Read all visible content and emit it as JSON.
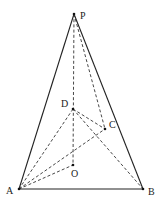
{
  "diagram": {
    "type": "geometry-3d-pyramid",
    "points": {
      "P": {
        "x": 74,
        "y": 14,
        "label": "P",
        "lx": 80,
        "ly": 19
      },
      "D": {
        "x": 73,
        "y": 109,
        "label": "D",
        "lx": 61,
        "ly": 107
      },
      "C": {
        "x": 105,
        "y": 129,
        "label": "C",
        "lx": 109,
        "ly": 128
      },
      "O": {
        "x": 73,
        "y": 165,
        "label": "O",
        "lx": 71,
        "ly": 177
      },
      "A": {
        "x": 19,
        "y": 189,
        "label": "A",
        "lx": 6,
        "ly": 194
      },
      "B": {
        "x": 143,
        "y": 189,
        "label": "B",
        "lx": 148,
        "ly": 195
      }
    },
    "solid_segments": [
      [
        "P",
        "A"
      ],
      [
        "P",
        "B"
      ],
      [
        "A",
        "B"
      ]
    ],
    "dashed_segments": [
      [
        "P",
        "O"
      ],
      [
        "P",
        "C"
      ],
      [
        "D",
        "A"
      ],
      [
        "D",
        "C"
      ],
      [
        "D",
        "B"
      ],
      [
        "A",
        "C"
      ],
      [
        "A",
        "O"
      ]
    ]
  }
}
